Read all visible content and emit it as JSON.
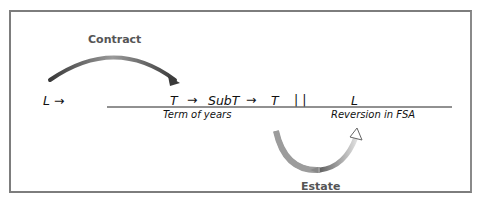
{
  "diagram": {
    "labels": {
      "contract": "Contract",
      "estate": "Estate"
    },
    "left_party": "L →",
    "chain": {
      "t1": "T",
      "arrow1": "→",
      "subt": "SubT",
      "arrow2": "→",
      "t2": "T",
      "divider": "| |",
      "l": "L"
    },
    "captions": {
      "term": "Term of years",
      "reversion": "Reversion in FSA"
    },
    "colors": {
      "border": "#7d7d7d",
      "arrow_dark": "#555555",
      "arrow_light": "#bdbdbd",
      "text": "#111111"
    }
  }
}
